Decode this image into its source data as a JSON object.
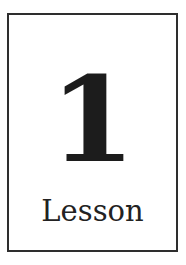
{
  "card": {
    "number": "1",
    "label": "Lesson",
    "border_color": "#2e2e2e",
    "text_color": "#1c1c1c",
    "background": "#ffffff"
  }
}
